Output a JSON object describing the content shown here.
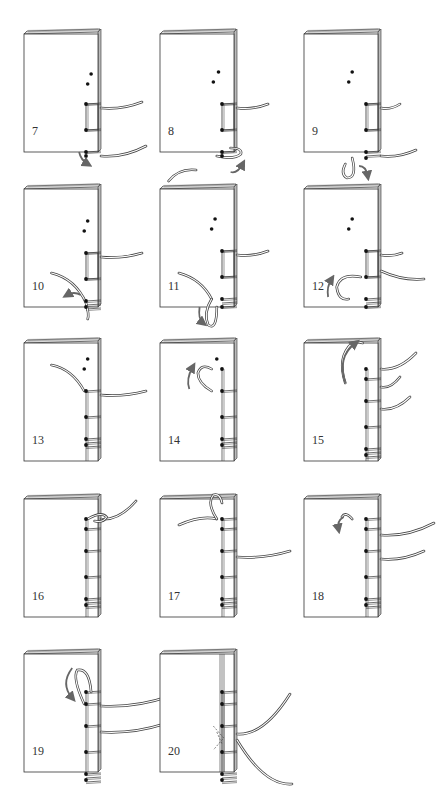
{
  "diagram": {
    "title": "",
    "colors": {
      "line": "#333333",
      "thread": "#444444",
      "arrow": "#666666",
      "background": "#ffffff"
    },
    "panels": [
      {
        "step": "7",
        "x": 24,
        "y": 28,
        "holes_empty": [
          [
            92,
            46
          ],
          [
            88,
            56
          ]
        ],
        "stitched_holes": [
          [
            88,
            76
          ],
          [
            88,
            102
          ],
          [
            88,
            124
          ],
          [
            91,
            128
          ]
        ],
        "frame": [
          76,
          102
        ],
        "wraps": [
          76,
          102,
          124
        ],
        "threads_out": [
          [
            [
              100,
              80
            ],
            [
              122,
              74
            ]
          ],
          [
            [
              100,
              128
            ],
            [
              126,
              118
            ]
          ]
        ],
        "loop": null,
        "arrow": {
          "path": "M78 124 Q80 132 88 136",
          "label": "curve-down"
        },
        "note": "thread wraps bottom; needle passes from front around spine"
      },
      {
        "step": "8",
        "x": 160,
        "y": 28,
        "holes_empty": [
          [
            82,
            44
          ],
          [
            76,
            54
          ]
        ],
        "stitched_holes": [
          [
            76,
            76
          ],
          [
            76,
            102
          ],
          [
            76,
            124
          ],
          [
            80,
            128
          ]
        ],
        "frame": [
          76,
          102
        ],
        "wraps": [
          76,
          102,
          124
        ],
        "threads_out": [
          [
            [
              90,
              80
            ],
            [
              112,
              76
            ]
          ]
        ],
        "loop": {
          "path": "M80 128 Q100 132 108 126 Q110 120 96 120"
        },
        "arrow": {
          "path": "M96 144 Q104 146 110 136",
          "label": "curve-up"
        },
        "thread_below": "M24 153 Q36 140 56 142"
      },
      {
        "step": "9",
        "x": 304,
        "y": 28,
        "holes_empty": [
          [
            70,
            44
          ],
          [
            66,
            54
          ]
        ],
        "stitched_holes": [
          [
            66,
            76
          ],
          [
            66,
            102
          ],
          [
            66,
            124
          ],
          [
            70,
            130
          ]
        ],
        "frame": [
          76,
          102
        ],
        "wraps": [
          76,
          102,
          124,
          128
        ],
        "threads_out": [
          [
            [
              80,
              80
            ],
            [
              100,
              76
            ]
          ],
          [
            [
              80,
              128
            ],
            [
              116,
              122
            ]
          ]
        ],
        "loop": {
          "path": "M70 130 Q76 150 64 150 Q56 146 62 136"
        },
        "arrow": {
          "path": "M78 138 Q86 138 88 148",
          "label": "curve-left"
        }
      },
      {
        "step": "10",
        "x": 24,
        "y": 183,
        "holes_empty": [
          [
            88,
            38
          ],
          [
            84,
            48
          ]
        ],
        "stitched_holes": [
          [
            84,
            70
          ],
          [
            84,
            96
          ],
          [
            84,
            118
          ],
          [
            88,
            124
          ]
        ],
        "frame": [
          70,
          96
        ],
        "wraps": [
          70,
          96,
          118,
          122,
          126
        ],
        "threads_out": [
          [
            [
              100,
              74
            ],
            [
              122,
              70
            ]
          ]
        ],
        "thread_curve": "M46 90 Q74 96 86 120 Q90 132 88 136",
        "arrow": {
          "path": "M80 112 Q72 108 64 112",
          "label": "arrow-left"
        }
      },
      {
        "step": "11",
        "x": 160,
        "y": 183,
        "holes_empty": [
          [
            78,
            36
          ],
          [
            74,
            46
          ]
        ],
        "stitched_holes": [
          [
            74,
            68
          ],
          [
            74,
            94
          ],
          [
            74,
            116
          ],
          [
            80,
            124
          ]
        ],
        "frame": [
          68,
          94
        ],
        "wraps": [
          68,
          94,
          116,
          120,
          124
        ],
        "threads_out": [
          [
            [
              92,
              72
            ],
            [
              112,
              68
            ]
          ]
        ],
        "thread_curve": "M36 90 Q62 96 74 116",
        "loop": {
          "path": "M74 116 Q64 130 70 142 Q80 148 80 124"
        },
        "arrow": {
          "path": "M60 124 Q58 136 64 140",
          "label": "arrow-down"
        }
      },
      {
        "step": "12",
        "x": 304,
        "y": 183,
        "holes_empty": [
          [
            70,
            36
          ],
          [
            66,
            46
          ]
        ],
        "stitched_holes": [
          [
            66,
            68
          ],
          [
            66,
            94
          ],
          [
            66,
            116
          ],
          [
            70,
            124
          ]
        ],
        "frame": [
          68,
          94
        ],
        "wraps": [
          68,
          94,
          116,
          120,
          124
        ],
        "threads_out": [
          [
            [
              80,
              72
            ],
            [
              102,
              70
            ]
          ],
          [
            [
              80,
              88
            ],
            [
              124,
              96
            ]
          ]
        ],
        "loop": {
          "path": "M80 94 Q56 90 52 104 Q54 118 66 116"
        },
        "arrow": {
          "path": "M42 114 Q40 104 46 96",
          "label": "arrow-up"
        }
      },
      {
        "step": "13",
        "x": 24,
        "y": 337,
        "holes_empty": [
          [
            88,
            22
          ],
          [
            84,
            32
          ]
        ],
        "stitched_holes": [
          [
            84,
            54
          ],
          [
            84,
            80
          ],
          [
            84,
            102
          ],
          [
            88,
            108
          ]
        ],
        "frame": null,
        "wraps": [
          54,
          80,
          102,
          106,
          110
        ],
        "threads_out": [
          [
            [
              100,
              58
            ],
            [
              126,
              54
            ]
          ]
        ],
        "thread_curve": "M46 28 Q70 32 84 54"
      },
      {
        "step": "14",
        "x": 160,
        "y": 337,
        "holes_empty": [
          [
            80,
            22
          ]
        ],
        "stitched_holes": [
          [
            74,
            32
          ],
          [
            74,
            54
          ],
          [
            74,
            80
          ],
          [
            74,
            102
          ],
          [
            78,
            108
          ]
        ],
        "frame": null,
        "wraps": [
          54,
          80,
          102,
          106,
          110
        ],
        "threads_out": [],
        "loop": {
          "path": "M74 32 Q62 26 58 36 Q58 46 74 54"
        },
        "arrow": {
          "path": "M48 52 Q44 42 52 30",
          "label": "arrow-up"
        }
      },
      {
        "step": "15",
        "x": 304,
        "y": 337,
        "holes_empty": [],
        "stitched_holes": [
          [
            70,
            32
          ],
          [
            66,
            42
          ],
          [
            66,
            64
          ],
          [
            66,
            90
          ],
          [
            66,
            112
          ],
          [
            70,
            118
          ]
        ],
        "frame": null,
        "wraps": [
          42,
          64,
          90,
          112,
          116,
          120
        ],
        "threads_out": [
          [
            [
              70,
              32
            ],
            [
              116,
              16
            ]
          ],
          [
            [
              78,
              50
            ],
            [
              100,
              40
            ]
          ],
          [
            [
              80,
              72
            ],
            [
              110,
              60
            ]
          ]
        ],
        "loop": {
          "path": "M62 46 Q52 20 70 6 Q76 4 82 6"
        },
        "arrow": {
          "path": "M62 46 Q52 20 74 6",
          "label": "arrow-up-right"
        }
      },
      {
        "step": "16",
        "x": 24,
        "y": 493,
        "holes_empty": [],
        "stitched_holes": [
          [
            88,
            26
          ],
          [
            84,
            36
          ],
          [
            84,
            58
          ],
          [
            84,
            84
          ],
          [
            84,
            106
          ],
          [
            88,
            112
          ]
        ],
        "frame": null,
        "wraps": [
          36,
          58,
          84,
          106,
          110,
          114
        ],
        "threads_out": [
          [
            [
              88,
              26
            ],
            [
              116,
              8
            ]
          ]
        ],
        "loop": {
          "path": "M88 26 Q104 18 110 24 Q106 30 96 28"
        }
      },
      {
        "step": "17",
        "x": 160,
        "y": 493,
        "holes_empty": [],
        "stitched_holes": [
          [
            80,
            26
          ],
          [
            74,
            36
          ],
          [
            74,
            58
          ],
          [
            74,
            84
          ],
          [
            74,
            106
          ],
          [
            78,
            112
          ]
        ],
        "frame": null,
        "wraps": [
          26,
          36,
          58,
          84,
          106,
          110,
          114
        ],
        "threads_out": [
          [
            [
              92,
              64
            ],
            [
              134,
              58
            ]
          ]
        ],
        "thread_curve": "M36 32 Q62 22 80 26",
        "loop": {
          "path": "M80 26 Q68 10 76 2 Q84 0 86 10"
        }
      },
      {
        "step": "18",
        "x": 304,
        "y": 493,
        "holes_empty": [],
        "stitched_holes": [
          [
            70,
            26
          ],
          [
            66,
            36
          ],
          [
            66,
            58
          ],
          [
            66,
            84
          ],
          [
            66,
            106
          ],
          [
            70,
            112
          ]
        ],
        "frame": null,
        "wraps": [
          26,
          36,
          58,
          84,
          106,
          110,
          114
        ],
        "threads_out": [
          [
            [
              80,
              42
            ],
            [
              134,
              30
            ]
          ],
          [
            [
              80,
              66
            ],
            [
              124,
              58
            ]
          ]
        ],
        "loop": {
          "path": "M70 26 Q62 18 58 24"
        },
        "arrow": {
          "path": "M60 24 Q52 28 54 36",
          "label": "arrow-down"
        }
      },
      {
        "step": "19",
        "x": 24,
        "y": 648,
        "holes_empty": [],
        "stitched_holes": [
          [
            90,
            44
          ],
          [
            84,
            56
          ],
          [
            84,
            78
          ],
          [
            84,
            104
          ],
          [
            84,
            126
          ],
          [
            88,
            132
          ]
        ],
        "frame": null,
        "wraps": [
          44,
          56,
          78,
          104,
          126,
          130,
          134
        ],
        "threads_out": [
          [
            [
              100,
              58
            ],
            [
              150,
              48
            ]
          ],
          [
            [
              100,
              84
            ],
            [
              144,
              76
            ]
          ]
        ],
        "loop": {
          "path": "M84 56 Q70 30 76 22 Q90 20 92 44"
        },
        "arrow": {
          "path": "M70 20 Q56 36 70 50",
          "label": "arrow-down-curve"
        }
      },
      {
        "step": "20",
        "x": 160,
        "y": 648,
        "holes_empty": [],
        "stitched_holes": [
          [
            80,
            44
          ],
          [
            74,
            56
          ],
          [
            74,
            78
          ],
          [
            74,
            104
          ],
          [
            74,
            126
          ],
          [
            78,
            132
          ]
        ],
        "frame": null,
        "wraps": [
          44,
          56,
          78,
          104,
          126,
          130,
          134
        ],
        "threads_out": [
          [
            [
              90,
              86
            ],
            [
              134,
              46
            ]
          ],
          [
            [
              90,
              92
            ],
            [
              136,
              136
            ]
          ]
        ],
        "knot": "M76 78 L88 90 L76 102 M80 84 L86 96",
        "spine_lines": 3
      }
    ]
  },
  "footer": {
    "text": ""
  }
}
